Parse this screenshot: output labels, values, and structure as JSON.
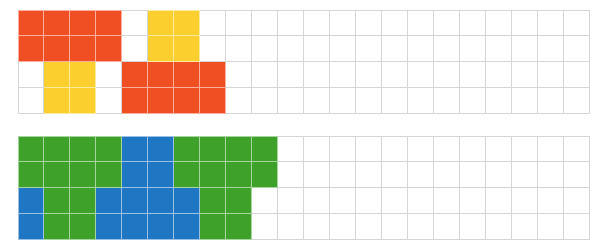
{
  "page": {
    "background_color": "#ffffff",
    "width": 606,
    "height": 252
  },
  "palette": {
    "orange": "#f04e23",
    "yellow": "#facf2e",
    "green": "#3ea12a",
    "blue": "#1f77c4",
    "empty": "#ffffff",
    "gridline": "#d6d6d6",
    "gridline_filled": "rgba(255,255,255,0.55)"
  },
  "grids": [
    {
      "name": "top-grid",
      "label": "Top grid",
      "origin_x": 18,
      "origin_y": 10,
      "cell_size": 26,
      "columns": 22,
      "rows": 4,
      "cells": [
        [
          "orange",
          "orange",
          "orange",
          "orange",
          "empty",
          "yellow",
          "yellow",
          "empty",
          "empty",
          "empty",
          "empty",
          "empty",
          "empty",
          "empty",
          "empty",
          "empty",
          "empty",
          "empty",
          "empty",
          "empty",
          "empty",
          "empty"
        ],
        [
          "orange",
          "orange",
          "orange",
          "orange",
          "empty",
          "yellow",
          "yellow",
          "empty",
          "empty",
          "empty",
          "empty",
          "empty",
          "empty",
          "empty",
          "empty",
          "empty",
          "empty",
          "empty",
          "empty",
          "empty",
          "empty",
          "empty"
        ],
        [
          "empty",
          "yellow",
          "yellow",
          "empty",
          "orange",
          "orange",
          "orange",
          "orange",
          "empty",
          "empty",
          "empty",
          "empty",
          "empty",
          "empty",
          "empty",
          "empty",
          "empty",
          "empty",
          "empty",
          "empty",
          "empty",
          "empty"
        ],
        [
          "empty",
          "yellow",
          "yellow",
          "empty",
          "orange",
          "orange",
          "orange",
          "orange",
          "empty",
          "empty",
          "empty",
          "empty",
          "empty",
          "empty",
          "empty",
          "empty",
          "empty",
          "empty",
          "empty",
          "empty",
          "empty",
          "empty"
        ]
      ]
    },
    {
      "name": "bottom-grid",
      "label": "Bottom grid",
      "origin_x": 18,
      "origin_y": 136,
      "cell_size": 26,
      "columns": 22,
      "rows": 4,
      "cells": [
        [
          "green",
          "green",
          "green",
          "green",
          "blue",
          "blue",
          "green",
          "green",
          "green",
          "green",
          "empty",
          "empty",
          "empty",
          "empty",
          "empty",
          "empty",
          "empty",
          "empty",
          "empty",
          "empty",
          "empty",
          "empty"
        ],
        [
          "green",
          "green",
          "green",
          "green",
          "blue",
          "blue",
          "green",
          "green",
          "green",
          "green",
          "empty",
          "empty",
          "empty",
          "empty",
          "empty",
          "empty",
          "empty",
          "empty",
          "empty",
          "empty",
          "empty",
          "empty"
        ],
        [
          "blue",
          "green",
          "green",
          "blue",
          "blue",
          "blue",
          "blue",
          "green",
          "green",
          "empty",
          "empty",
          "empty",
          "empty",
          "empty",
          "empty",
          "empty",
          "empty",
          "empty",
          "empty",
          "empty",
          "empty",
          "empty"
        ],
        [
          "blue",
          "green",
          "green",
          "blue",
          "blue",
          "blue",
          "blue",
          "green",
          "green",
          "empty",
          "empty",
          "empty",
          "empty",
          "empty",
          "empty",
          "empty",
          "empty",
          "empty",
          "empty",
          "empty",
          "empty",
          "empty"
        ]
      ]
    }
  ]
}
